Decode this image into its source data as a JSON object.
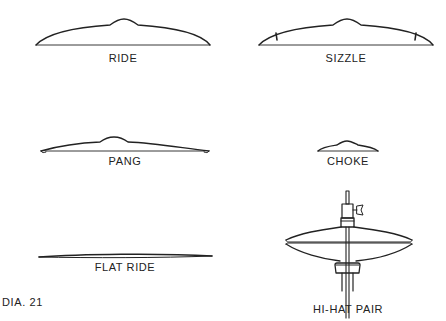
{
  "diagram": {
    "caption": "DIA. 21",
    "cymbals": [
      {
        "id": "ride",
        "label": "RIDE"
      },
      {
        "id": "sizzle",
        "label": "SIZZLE"
      },
      {
        "id": "pang",
        "label": "PANG"
      },
      {
        "id": "choke",
        "label": "CHOKE"
      },
      {
        "id": "flat-ride",
        "label": "FLAT RIDE"
      },
      {
        "id": "hi-hat-pair",
        "label": "HI-HAT PAIR"
      }
    ],
    "colors": {
      "line": "#222222",
      "background": "#ffffff"
    }
  }
}
